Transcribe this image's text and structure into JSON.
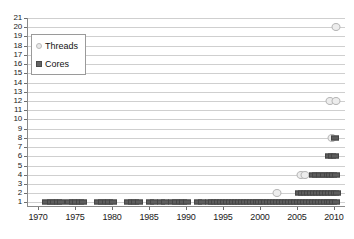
{
  "chart_data": {
    "type": "scatter",
    "title": "Processor core and thread counts",
    "xlabel": "",
    "ylabel": "",
    "xlim": [
      1968.5,
      2011.5
    ],
    "ylim": [
      0.5,
      21
    ],
    "grid": true,
    "legend_position": "upper-left",
    "xticks": [
      1970,
      1975,
      1980,
      1985,
      1990,
      1995,
      2000,
      2005,
      2010
    ],
    "yticks": [
      1,
      2,
      3,
      4,
      5,
      6,
      7,
      8,
      9,
      10,
      11,
      12,
      13,
      14,
      15,
      16,
      17,
      18,
      19,
      20,
      21
    ],
    "series": [
      {
        "name": "Cores",
        "marker": "square",
        "color": "#5d5d5d",
        "points": [
          [
            1971,
            1
          ],
          [
            1971.6,
            1
          ],
          [
            1972,
            1
          ],
          [
            1972.5,
            1
          ],
          [
            1973,
            1
          ],
          [
            1974,
            1
          ],
          [
            1974.6,
            1
          ],
          [
            1975,
            1
          ],
          [
            1975.5,
            1
          ],
          [
            1976,
            1
          ],
          [
            1978,
            1
          ],
          [
            1978.5,
            1
          ],
          [
            1979,
            1
          ],
          [
            1979.5,
            1
          ],
          [
            1980,
            1
          ],
          [
            1982,
            1
          ],
          [
            1982.5,
            1
          ],
          [
            1983,
            1
          ],
          [
            1983.5,
            1
          ],
          [
            1985,
            1
          ],
          [
            1985.6,
            1
          ],
          [
            1986.5,
            1
          ],
          [
            1987,
            1
          ],
          [
            1988,
            1
          ],
          [
            1988.5,
            1
          ],
          [
            1989,
            1
          ],
          [
            1989.5,
            1
          ],
          [
            1990,
            1
          ],
          [
            1991.5,
            1
          ],
          [
            1992,
            1
          ],
          [
            1993,
            1
          ],
          [
            1993.4,
            1
          ],
          [
            1993.8,
            1
          ],
          [
            1994.2,
            1
          ],
          [
            1994.6,
            1
          ],
          [
            1995,
            1
          ],
          [
            1995.4,
            1
          ],
          [
            1995.8,
            1
          ],
          [
            1996.2,
            1
          ],
          [
            1996.6,
            1
          ],
          [
            1997,
            1
          ],
          [
            1997.4,
            1
          ],
          [
            1997.8,
            1
          ],
          [
            1998.2,
            1
          ],
          [
            1998.6,
            1
          ],
          [
            1999,
            1
          ],
          [
            1999.4,
            1
          ],
          [
            1999.8,
            1
          ],
          [
            2000.2,
            1
          ],
          [
            2000.6,
            1
          ],
          [
            2001,
            1
          ],
          [
            2001.4,
            1
          ],
          [
            2001.8,
            1
          ],
          [
            2002.2,
            1
          ],
          [
            2002.6,
            1
          ],
          [
            2003,
            1
          ],
          [
            2003.4,
            1
          ],
          [
            2003.8,
            1
          ],
          [
            2004.2,
            1
          ],
          [
            2004.6,
            1
          ],
          [
            2005,
            1
          ],
          [
            2005.4,
            1
          ],
          [
            2005.8,
            1
          ],
          [
            2006.2,
            1
          ],
          [
            2006.6,
            1
          ],
          [
            2007,
            1
          ],
          [
            2007.4,
            1
          ],
          [
            2007.8,
            1
          ],
          [
            2008.2,
            1
          ],
          [
            2008.6,
            1
          ],
          [
            2009,
            1
          ],
          [
            2009.4,
            1
          ],
          [
            2009.8,
            1
          ],
          [
            2010.2,
            1
          ],
          [
            2005.2,
            2
          ],
          [
            2005.6,
            2
          ],
          [
            2006,
            2
          ],
          [
            2006.4,
            2
          ],
          [
            2006.8,
            2
          ],
          [
            2007.2,
            2
          ],
          [
            2007.6,
            2
          ],
          [
            2008,
            2
          ],
          [
            2008.4,
            2
          ],
          [
            2008.8,
            2
          ],
          [
            2009.2,
            2
          ],
          [
            2009.6,
            2
          ],
          [
            2010,
            2
          ],
          [
            2010.3,
            2
          ],
          [
            2007,
            4
          ],
          [
            2007.5,
            4
          ],
          [
            2008,
            4
          ],
          [
            2008.5,
            4
          ],
          [
            2009,
            4
          ],
          [
            2009.4,
            4
          ],
          [
            2009.8,
            4
          ],
          [
            2010.2,
            4
          ],
          [
            2009.2,
            6
          ],
          [
            2009.6,
            6
          ],
          [
            2010,
            6
          ],
          [
            2010,
            8
          ]
        ]
      },
      {
        "name": "Threads",
        "marker": "circle",
        "color": "#ededed",
        "points": [
          [
            2002.2,
            2
          ],
          [
            2005.4,
            4
          ],
          [
            2005.9,
            4
          ],
          [
            2009.6,
            8
          ],
          [
            2009.4,
            12
          ],
          [
            2010.1,
            12
          ],
          [
            2010.2,
            20
          ]
        ]
      }
    ]
  },
  "legend": {
    "items": [
      {
        "label": "Threads",
        "marker": "circle"
      },
      {
        "label": "Cores",
        "marker": "square"
      }
    ]
  }
}
